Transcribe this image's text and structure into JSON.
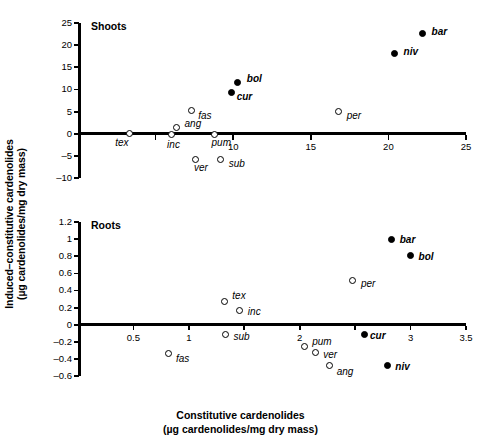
{
  "figure": {
    "ylabel_line1": "Induced–constitutive cardenolides",
    "ylabel_line2": "(µg cardenolides/mg dry mass)",
    "xlabel_line1": "Constitutive cardenolides",
    "xlabel_line2": "(µg cardenolides/mg dry mass)"
  },
  "chart_data": [
    {
      "type": "scatter",
      "title": "Shoots",
      "xlabel": "Constitutive cardenolides (µg cardenolides/mg dry mass)",
      "ylabel": "Induced–constitutive cardenolides (µg cardenolides/mg dry mass)",
      "xlim": [
        0,
        25
      ],
      "ylim": [
        -10,
        25
      ],
      "xticks": [
        0,
        5,
        10,
        15,
        20,
        25
      ],
      "xticklabels": [
        "",
        "",
        "10",
        "15",
        "20",
        "25"
      ],
      "yticks": [
        -10,
        -5,
        0,
        5,
        10,
        15,
        20,
        25
      ],
      "yticklabels": [
        "–10",
        "–5",
        "0",
        "5",
        "10",
        "15",
        "20",
        "25"
      ],
      "grid": false,
      "legend": "none",
      "zero_line": true,
      "points": [
        {
          "label": "tex",
          "x": 3.3,
          "y": -0.05,
          "fill": "open",
          "lx": -14,
          "ly": 9
        },
        {
          "label": "inc",
          "x": 6.0,
          "y": -0.15,
          "fill": "open",
          "lx": -4,
          "ly": 11
        },
        {
          "label": "ang",
          "x": 6.35,
          "y": 1.5,
          "fill": "open",
          "lx": 8,
          "ly": -3
        },
        {
          "label": "fas",
          "x": 7.3,
          "y": 5.2,
          "fill": "open",
          "lx": 7,
          "ly": 5
        },
        {
          "label": "ver",
          "x": 7.6,
          "y": -5.9,
          "fill": "open",
          "lx": -2,
          "ly": 8
        },
        {
          "label": "pum",
          "x": 8.8,
          "y": -0.15,
          "fill": "open",
          "lx": -3,
          "ly": 9
        },
        {
          "label": "sub",
          "x": 9.2,
          "y": -5.9,
          "fill": "open",
          "lx": 8,
          "ly": 4
        },
        {
          "label": "cur",
          "x": 9.9,
          "y": 9.4,
          "fill": "filled",
          "lx": 5,
          "ly": 5,
          "bold": true
        },
        {
          "label": "bol",
          "x": 10.3,
          "y": 11.5,
          "fill": "filled",
          "lx": 9,
          "ly": -4,
          "bold": true
        },
        {
          "label": "per",
          "x": 16.8,
          "y": 5.0,
          "fill": "open",
          "lx": 8,
          "ly": 4
        },
        {
          "label": "niv",
          "x": 20.4,
          "y": 18.2,
          "fill": "filled",
          "lx": 9,
          "ly": -1,
          "bold": true
        },
        {
          "label": "bar",
          "x": 22.2,
          "y": 22.7,
          "fill": "filled",
          "lx": 9,
          "ly": -1,
          "bold": true
        }
      ]
    },
    {
      "type": "scatter",
      "title": "Roots",
      "xlabel": "Constitutive cardenolides (µg cardenolides/mg dry mass)",
      "ylabel": "Induced–constitutive cardenolides (µg cardenolides/mg dry mass)",
      "xlim": [
        0,
        3.5
      ],
      "ylim": [
        -0.6,
        1.2
      ],
      "xticks": [
        0,
        0.5,
        1,
        1.5,
        2,
        2.5,
        3,
        3.5
      ],
      "xticklabels": [
        "",
        "0.5",
        "1",
        "",
        "2",
        "",
        "3",
        "3.5"
      ],
      "yticks": [
        -0.6,
        -0.4,
        -0.2,
        0,
        0.2,
        0.4,
        0.6,
        0.8,
        1,
        1.2
      ],
      "yticklabels": [
        "–0.6",
        "–0.4",
        "–0.2",
        "0",
        "0.2",
        "0.4",
        "0.6",
        "0.8",
        "1",
        "1.2"
      ],
      "grid": false,
      "legend": "none",
      "zero_line": true,
      "points": [
        {
          "label": "fas",
          "x": 0.82,
          "y": -0.34,
          "fill": "open",
          "lx": 7,
          "ly": 5
        },
        {
          "label": "tex",
          "x": 1.32,
          "y": 0.27,
          "fill": "open",
          "lx": 8,
          "ly": -6
        },
        {
          "label": "sub",
          "x": 1.33,
          "y": -0.11,
          "fill": "open",
          "lx": 8,
          "ly": 3
        },
        {
          "label": "inc",
          "x": 1.46,
          "y": 0.16,
          "fill": "open",
          "lx": 8,
          "ly": 1
        },
        {
          "label": "pum",
          "x": 2.04,
          "y": -0.25,
          "fill": "open",
          "lx": 8,
          "ly": -4
        },
        {
          "label": "ver",
          "x": 2.14,
          "y": -0.33,
          "fill": "open",
          "lx": 8,
          "ly": 2
        },
        {
          "label": "ang",
          "x": 2.27,
          "y": -0.48,
          "fill": "open",
          "lx": 7,
          "ly": 6
        },
        {
          "label": "per",
          "x": 2.48,
          "y": 0.52,
          "fill": "open",
          "lx": 8,
          "ly": 4
        },
        {
          "label": "cur",
          "x": 2.58,
          "y": -0.11,
          "fill": "filled",
          "lx": 6,
          "ly": 2,
          "bold": true
        },
        {
          "label": "niv",
          "x": 2.79,
          "y": -0.48,
          "fill": "filled",
          "lx": 8,
          "ly": 1,
          "bold": true
        },
        {
          "label": "bar",
          "x": 2.83,
          "y": 0.99,
          "fill": "filled",
          "lx": 8,
          "ly": 0,
          "bold": true
        },
        {
          "label": "bol",
          "x": 3.0,
          "y": 0.81,
          "fill": "filled",
          "lx": 8,
          "ly": 2,
          "bold": true
        }
      ]
    }
  ]
}
